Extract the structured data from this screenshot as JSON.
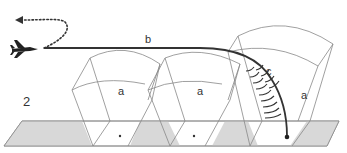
{
  "figure": {
    "number_label": "2",
    "path_label": "b",
    "descent_label": "c",
    "zone_labels": [
      "a",
      "a",
      "a"
    ]
  },
  "icons": {
    "aircraft": "jet-aircraft-icon",
    "return_arrow": "dotted-arrow-left-icon",
    "impact_point": "dot-icon"
  },
  "colors": {
    "line": "#333333",
    "thin_line": "#888888",
    "ground_fill": "#d8d8d8",
    "ground_stroke": "#888888",
    "background": "#ffffff"
  }
}
